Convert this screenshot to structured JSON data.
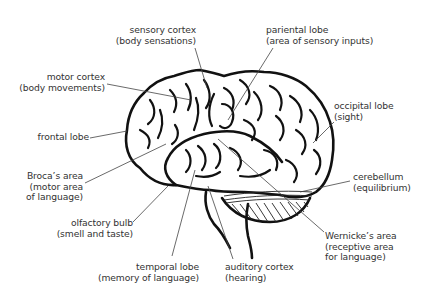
{
  "diagram": {
    "line_color": "#111111",
    "leader_color": "#444444",
    "text_color": "#333333",
    "labels": {
      "sensory_cortex": {
        "title": "sensory cortex",
        "note": "(body sensations)"
      },
      "parietal_lobe": {
        "title": "pariental lobe",
        "note": "(area of sensory inputs)"
      },
      "motor_cortex": {
        "title": "motor cortex",
        "note": "(body movements)"
      },
      "occipital_lobe": {
        "title": "occipital lobe",
        "note": "(sight)"
      },
      "frontal_lobe": {
        "title": "frontal lobe"
      },
      "brocas_area": {
        "title": "Broca’s area",
        "note1": "(motor area",
        "note2": "of language)"
      },
      "cerebellum": {
        "title": "cerebellum",
        "note": "(equilibrium)"
      },
      "olfactory_bulb": {
        "title": "olfactory bulb",
        "note": "(smell and taste)"
      },
      "wernickes_area": {
        "title": "Wernicke’s area",
        "note1": "(receptive area",
        "note2": "for language)"
      },
      "temporal_lobe": {
        "title": "temporal lobe",
        "note": "(memory of language)"
      },
      "auditory_cortex": {
        "title": "auditory cortex",
        "note": "(hearing)"
      }
    }
  }
}
